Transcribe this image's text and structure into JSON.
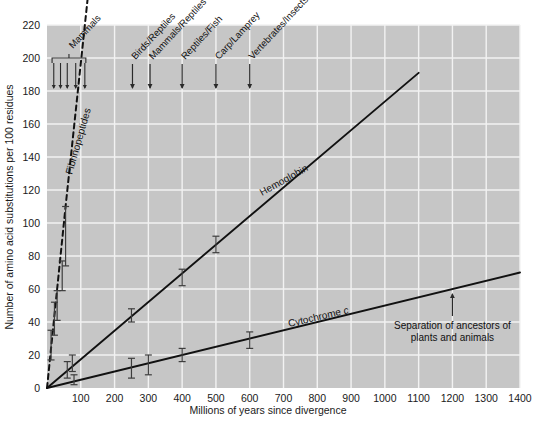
{
  "figure": {
    "background_color": "#ffffff",
    "plot_background_color": "#c6c6c6",
    "grid_color": "#f2f2f2",
    "line_color": "#111111"
  },
  "chart_data": {
    "type": "line",
    "title": "",
    "xlabel": "Millions of years since divergence",
    "ylabel": "Number of amino acid substitutions per 100 residues",
    "xlim": [
      0,
      1400
    ],
    "ylim": [
      0,
      220
    ],
    "xticks": [
      0,
      100,
      200,
      300,
      400,
      500,
      600,
      700,
      800,
      900,
      1000,
      1100,
      1200,
      1300,
      1400
    ],
    "xtick_labels": [
      "0",
      "100",
      "200",
      "300",
      "400",
      "500",
      "600",
      "700",
      "800",
      "900",
      "1000",
      "1100",
      "1200",
      "1300",
      "1400"
    ],
    "yticks": [
      0,
      20,
      40,
      60,
      80,
      100,
      120,
      140,
      160,
      180,
      200,
      220
    ],
    "ytick_labels": [
      "0",
      "20",
      "40",
      "60",
      "80",
      "100",
      "120",
      "140",
      "160",
      "180",
      "200",
      "220"
    ],
    "grid": true,
    "legend": "inline-labels",
    "series": [
      {
        "name": "Fibrinopeptides",
        "label": "Fibrinopeptides",
        "style": "dashed",
        "line": [
          [
            0,
            0
          ],
          [
            55,
            110
          ],
          [
            125,
            245
          ]
        ],
        "points": [
          {
            "x": 12,
            "y": 26,
            "yerr": 9
          },
          {
            "x": 22,
            "y": 42,
            "yerr": 10
          },
          {
            "x": 30,
            "y": 50,
            "yerr": 9
          },
          {
            "x": 45,
            "y": 68,
            "yerr": 9
          },
          {
            "x": 55,
            "y": 92,
            "yerr": 18
          }
        ]
      },
      {
        "name": "Hemoglobin",
        "label": "Hemoglobin",
        "style": "solid",
        "line": [
          [
            0,
            0
          ],
          [
            1100,
            191
          ]
        ],
        "points": [
          {
            "x": 60,
            "y": 11,
            "yerr": 5
          },
          {
            "x": 75,
            "y": 15,
            "yerr": 5
          },
          {
            "x": 250,
            "y": 44,
            "yerr": 4
          },
          {
            "x": 400,
            "y": 67,
            "yerr": 5
          },
          {
            "x": 500,
            "y": 87,
            "yerr": 5
          }
        ]
      },
      {
        "name": "Cytochrome c",
        "label": "Cytochrome c",
        "style": "solid",
        "line": [
          [
            0,
            0
          ],
          [
            1400,
            70
          ]
        ],
        "points": [
          {
            "x": 80,
            "y": 5,
            "yerr": 3
          },
          {
            "x": 250,
            "y": 12,
            "yerr": 6
          },
          {
            "x": 300,
            "y": 14,
            "yerr": 6
          },
          {
            "x": 400,
            "y": 20,
            "yerr": 4
          },
          {
            "x": 600,
            "y": 29,
            "yerr": 5
          }
        ]
      }
    ],
    "divergence_events": [
      {
        "label": "Mammals",
        "x": 70,
        "bracket": true,
        "bracket_from": 15,
        "bracket_to": 115,
        "ticks": [
          20,
          40,
          60,
          85,
          112
        ]
      },
      {
        "label": "Birds/Reptiles",
        "x": 253
      },
      {
        "label": "Mammals/Reptiles",
        "x": 305
      },
      {
        "label": "Reptiles/Fish",
        "x": 400
      },
      {
        "label": "Carp/Lamprey",
        "x": 500
      },
      {
        "label": "Vertebrates/Insects",
        "x": 600
      }
    ],
    "annotations": [
      {
        "label_line1": "Separation of ancestors of",
        "label_line2": "plants and animals",
        "x": 1200,
        "y": 60,
        "arrow": "up"
      }
    ]
  }
}
